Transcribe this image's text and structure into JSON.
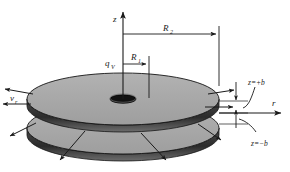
{
  "figure": {
    "kind": "technical-line-diagram",
    "background_color": "#ffffff",
    "line_color": "#1a1a1a",
    "disk_face_color": "#a8a8a8",
    "disk_rim_color": "#2b2b2b",
    "disk_edge_band_color": "#8a8a8a",
    "hole_color": "#111111"
  },
  "labels": {
    "z_axis": "z",
    "r_axis": "r",
    "radius_outer": "R",
    "radius_outer_sub": "2",
    "radius_inner": "R",
    "radius_inner_sub": "1",
    "flow_rate": "q",
    "flow_rate_sub": "V",
    "velocity_radial": "v",
    "velocity_radial_sub": "r",
    "gap_top": "z=+b",
    "gap_bottom": "z=−b"
  },
  "geometry": {
    "axis_origin_x": 123,
    "axis_origin_y": 99,
    "z_axis_top_y": 10,
    "top_disk_center": {
      "cx": 123,
      "cy": 99
    },
    "top_disk_rx": 96,
    "top_disk_ry": 26,
    "top_disk_thickness": 7,
    "bottom_disk_center": {
      "cx": 123,
      "cy": 128
    },
    "bottom_disk_rx": 96,
    "bottom_disk_ry": 26,
    "bottom_disk_thickness": 7,
    "hole_rx": 13,
    "hole_ry": 4,
    "r2_dim_y": 34,
    "r1_dim_y": 64,
    "r2_extent_x": 219,
    "r1_extent_x": 149
  },
  "annotations": {
    "outflow_arrows_left": 2,
    "outflow_arrows_right": 2,
    "lower_leader_arrows": 4,
    "gap_dimension_arrows": 2
  }
}
